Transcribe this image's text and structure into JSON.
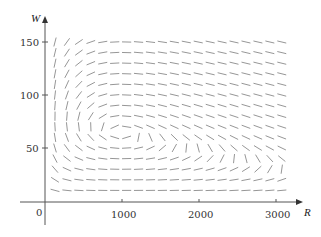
{
  "chart_data": {
    "type": "direction_field",
    "title": "",
    "xlabel": "R",
    "ylabel": "W",
    "x_ticks": [
      0,
      1000,
      2000,
      3000
    ],
    "x_tick_labels": [
      "0",
      "1000",
      "2000",
      "3000"
    ],
    "y_ticks": [
      50,
      100,
      150
    ],
    "y_tick_labels": [
      "50",
      "100",
      "150"
    ],
    "origin_label": "0",
    "xlim": [
      0,
      3300
    ],
    "ylim": [
      0,
      160
    ],
    "grid": false,
    "legend": null,
    "system": {
      "dR_dt": "0.08R(1 - 0.0002R) - 0.001RW",
      "dW_dt": "-0.02W + 0.00002RW",
      "equilibrium": [
        1000,
        80
      ]
    },
    "field_grid": {
      "r_start": 130,
      "r_step": 155,
      "r_count": 20,
      "w_start": 10,
      "w_step": 10,
      "w_count": 15
    },
    "colors": {
      "axis": "#555555",
      "segment": "#8a8a8a",
      "text": "#333333"
    }
  }
}
